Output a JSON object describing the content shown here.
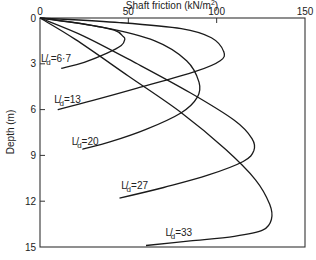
{
  "chart_data": {
    "type": "line",
    "title": "",
    "xlabel": "Shaft friction (kN/m²)",
    "ylabel": "Depth (m)",
    "xlim": [
      0,
      150
    ],
    "ylim": [
      0,
      15
    ],
    "y_inverted": true,
    "x_axis_position": "top",
    "x_ticks": [
      0,
      50,
      100,
      150
    ],
    "y_ticks": [
      0,
      3,
      6,
      9,
      12,
      15
    ],
    "grid": false,
    "legend": "inline labels",
    "series": [
      {
        "name": "L/d = 6.7",
        "points": [
          [
            0,
            0
          ],
          [
            25,
            0.4
          ],
          [
            42,
            0.8
          ],
          [
            47,
            1.2
          ],
          [
            48,
            1.4
          ],
          [
            46,
            1.8
          ],
          [
            38,
            2.3
          ],
          [
            25,
            2.9
          ],
          [
            12,
            3.3
          ]
        ],
        "label": {
          "text_main": "L",
          "text_sub": "d",
          "value": "=6·7",
          "x": 0.5,
          "y": 2.9
        }
      },
      {
        "name": "L/d = 13",
        "points": [
          [
            0,
            0
          ],
          [
            45,
            0.3
          ],
          [
            80,
            0.7
          ],
          [
            97,
            1.3
          ],
          [
            104,
            2.2
          ],
          [
            102,
            2.8
          ],
          [
            88,
            3.5
          ],
          [
            55,
            4.6
          ],
          [
            30,
            5.4
          ],
          [
            10,
            6.0
          ]
        ],
        "label": {
          "text_main": "L",
          "text_sub": "d",
          "value": "=13",
          "x": 8,
          "y": 5.6
        }
      },
      {
        "name": "L/d = 20",
        "points": [
          [
            0,
            0
          ],
          [
            35,
            0.6
          ],
          [
            65,
            1.5
          ],
          [
            83,
            2.8
          ],
          [
            90,
            4.2
          ],
          [
            89,
            5.2
          ],
          [
            80,
            6.2
          ],
          [
            60,
            7.3
          ],
          [
            40,
            8.1
          ],
          [
            24,
            8.6
          ]
        ],
        "label": {
          "text_main": "L",
          "text_sub": "d",
          "value": "=20",
          "x": 18,
          "y": 8.3
        }
      },
      {
        "name": "L/d = 27",
        "points": [
          [
            0,
            0
          ],
          [
            25,
            1.2
          ],
          [
            55,
            3.0
          ],
          [
            85,
            4.9
          ],
          [
            110,
            6.7
          ],
          [
            120,
            7.9
          ],
          [
            121,
            8.7
          ],
          [
            115,
            9.4
          ],
          [
            95,
            10.3
          ],
          [
            70,
            11.1
          ],
          [
            45,
            11.8
          ]
        ],
        "label": {
          "text_main": "L",
          "text_sub": "d",
          "value": "=27",
          "x": 46,
          "y": 11.2
        }
      },
      {
        "name": "L/d = 33",
        "points": [
          [
            0,
            0
          ],
          [
            20,
            1.4
          ],
          [
            50,
            3.8
          ],
          [
            80,
            6.2
          ],
          [
            105,
            8.6
          ],
          [
            122,
            10.6
          ],
          [
            130,
            12.2
          ],
          [
            131,
            13.2
          ],
          [
            126,
            13.9
          ],
          [
            110,
            14.3
          ],
          [
            85,
            14.6
          ],
          [
            60,
            14.9
          ]
        ],
        "label": {
          "text_main": "L",
          "text_sub": "d",
          "value": "=33",
          "x": 71,
          "y": 14.3
        }
      }
    ]
  },
  "axes": {
    "x_title": "Shaft friction  (kN/m",
    "x_title_sup": "2",
    "x_title_end": ")",
    "y_title": "Depth   (m)",
    "x_tick_labels": [
      "0",
      "50",
      "100",
      "150"
    ],
    "y_tick_labels": [
      "0",
      "3",
      "6",
      "9",
      "12",
      "15"
    ]
  }
}
